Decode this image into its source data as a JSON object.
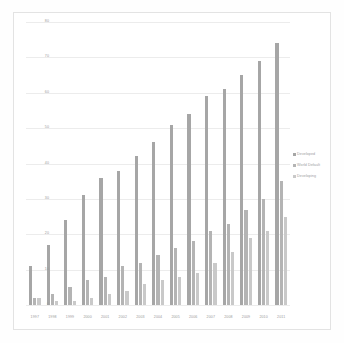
{
  "chart_data": {
    "type": "bar",
    "title": "",
    "subtitle": "",
    "xlabel": "",
    "ylabel": "",
    "ylim": [
      0,
      80
    ],
    "yticks": [
      0,
      10,
      20,
      30,
      40,
      50,
      60,
      70,
      80
    ],
    "ytick_labels": [
      "0",
      "10",
      "20",
      "30",
      "40",
      "50",
      "60",
      "70",
      "80"
    ],
    "grid": true,
    "legend_position": "right",
    "categories": [
      "1997",
      "1998",
      "1999",
      "2000",
      "2001",
      "2002",
      "2003",
      "2004",
      "2005",
      "2006",
      "2007",
      "2008",
      "2009",
      "2010",
      "2011"
    ],
    "series": [
      {
        "name": "Developed",
        "color": "#a6a6a6",
        "values": [
          11,
          17,
          24,
          31,
          36,
          38,
          42,
          46,
          51,
          54,
          59,
          61,
          65,
          69,
          74
        ]
      },
      {
        "name": "World Default",
        "color": "#b4b4b4",
        "values": [
          2,
          3,
          5,
          7,
          8,
          11,
          12,
          14,
          16,
          18,
          21,
          23,
          27,
          30,
          35
        ]
      },
      {
        "name": "Developing",
        "color": "#c9c9c9",
        "values": [
          2,
          1,
          1,
          2,
          3,
          4,
          6,
          7,
          8,
          9,
          12,
          15,
          19,
          21,
          25
        ]
      }
    ]
  }
}
